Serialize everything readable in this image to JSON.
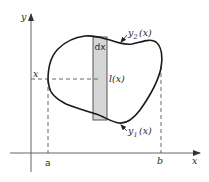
{
  "diagram": {
    "axes": {
      "x_label": "x",
      "y_label": "y"
    },
    "bounds": {
      "left_label": "a",
      "right_label": "b"
    },
    "strip": {
      "width_label": "dx",
      "length_label": "l(x)",
      "position_label": "x"
    },
    "curves": {
      "upper": {
        "base": "y",
        "sub": "2",
        "arg": "(x)"
      },
      "lower": {
        "base": "y",
        "sub": "1",
        "arg": "(x)"
      }
    },
    "colors": {
      "stroke": "#1a1a1a",
      "strip_fill": "#d6d6d6",
      "axis": "#555555",
      "dash": "#555555"
    }
  }
}
